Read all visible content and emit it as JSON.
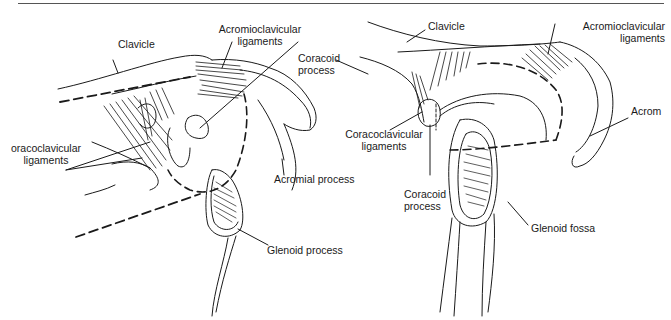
{
  "figure": {
    "top_rule": true,
    "left_view": {
      "labels": {
        "clavicle": "Clavicle",
        "acromioclavicular_1": "Acromioclavicular",
        "acromioclavicular_2": "ligaments",
        "coracoid_1": "Coracoid",
        "coracoid_2": "process",
        "coracoclavicular_1": "oracoclavicular",
        "coracoclavicular_2": "ligaments",
        "acromial": "Acromial process",
        "glenoid": "Glenoid process"
      }
    },
    "right_view": {
      "labels": {
        "clavicle": "Clavicle",
        "acromioclavicular_1": "Acromioclavicular",
        "acromioclavicular_2": "ligaments",
        "acromion": "Acrom",
        "coracoclavicular_1": "Coracoclavicular",
        "coracoclavicular_2": "ligaments",
        "coracoid_1": "Coracoid",
        "coracoid_2": "process",
        "glenoid_fossa": "Glenoid fossa"
      }
    }
  }
}
